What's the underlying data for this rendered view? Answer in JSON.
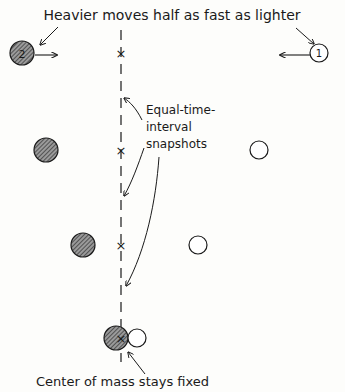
{
  "diagram": {
    "title": "Heavier moves half as fast as lighter",
    "annotation_snapshots": [
      "Equal-time-",
      "interval",
      "snapshots"
    ],
    "annotation_com": "Center of mass stays fixed",
    "heavy_label": "2",
    "light_label": "1",
    "colors": {
      "ink": "#1a1a1a",
      "hatch": "#333333",
      "paper": "#fdfdfb"
    },
    "snapshots": [
      {
        "heavy_x": 22,
        "light_x": 319,
        "y": 53,
        "com_x": 121
      },
      {
        "heavy_x": 46,
        "light_x": 259,
        "y": 150,
        "com_x": 121
      },
      {
        "heavy_x": 83,
        "light_x": 198,
        "y": 245,
        "com_x": 121
      },
      {
        "heavy_x": 119,
        "light_x": 137,
        "y": 339,
        "com_x": 121
      }
    ]
  }
}
